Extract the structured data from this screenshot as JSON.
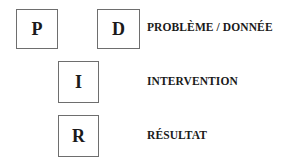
{
  "diagram": {
    "boxes": {
      "p": "P",
      "d": "D",
      "i": "I",
      "r": "R"
    },
    "labels": {
      "problem": "PROBLÈME / DONNÉE",
      "intervention": "INTERVENTION",
      "result": "RÉSULTAT"
    }
  }
}
